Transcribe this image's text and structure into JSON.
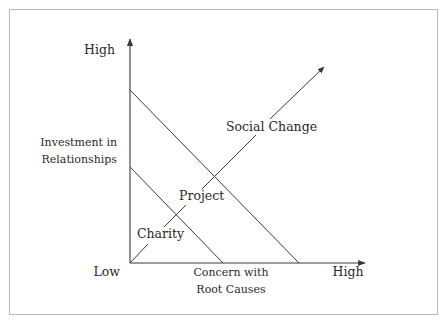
{
  "diagram": {
    "y_axis": {
      "high_label": "High",
      "title_line1": "Investment in",
      "title_line2": "Relationships"
    },
    "x_axis": {
      "low_label": "Low",
      "title_line1": "Concern with",
      "title_line2": "Root Causes",
      "high_label": "High"
    },
    "regions": {
      "charity": "Charity",
      "project": "Project",
      "social_change": "Social Change"
    },
    "colors": {
      "line": "#3a3a3a",
      "text": "#2a2a2a",
      "frame": "#b8b8b8"
    }
  }
}
